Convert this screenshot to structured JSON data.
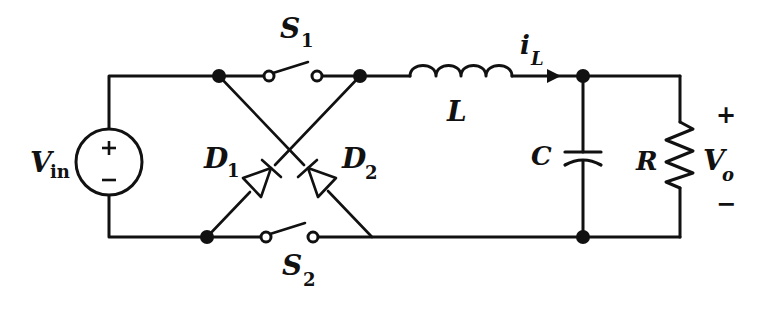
{
  "diagram": {
    "type": "circuit-schematic",
    "source": {
      "label": "V",
      "subscript": "in",
      "plus": "+",
      "minus": "−"
    },
    "switches": [
      {
        "label": "S",
        "subscript": "1",
        "position": "top"
      },
      {
        "label": "S",
        "subscript": "2",
        "position": "bottom"
      }
    ],
    "diodes": [
      {
        "label": "D",
        "subscript": "1"
      },
      {
        "label": "D",
        "subscript": "2"
      }
    ],
    "inductor": {
      "label": "L"
    },
    "current": {
      "label": "i",
      "subscript": "L"
    },
    "capacitor": {
      "label": "C"
    },
    "resistor": {
      "label": "R"
    },
    "output": {
      "label": "V",
      "subscript": "o",
      "plus": "+",
      "minus": "−"
    },
    "colors": {
      "stroke": "#111111",
      "background": "#ffffff"
    }
  }
}
